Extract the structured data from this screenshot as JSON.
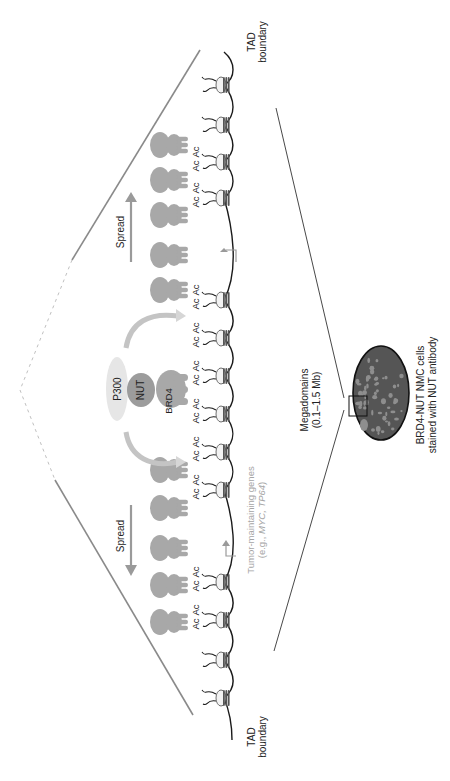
{
  "figure": {
    "orientation": "rotated-90-ccw",
    "labels": {
      "tad_boundary_top_line1": "TAD",
      "tad_boundary_top_line2": "boundary",
      "tad_boundary_bottom_line1": "TAD",
      "tad_boundary_bottom_line2": "boundary",
      "spread_upper": "Spread",
      "spread_lower": "Spread",
      "p300": "P300",
      "nut": "NUT",
      "brd4": "BRD4",
      "acetyl_mark": "Ac",
      "genes_line1": "Tumor-maintaining genes",
      "genes_line2_prefix": "(e.g., ",
      "genes_line2_italic": "MYC, TP64",
      "genes_line2_suffix": ")",
      "megadomains_line1": "Megadomains",
      "megadomains_line2": "(0.1–1.5 Mb)",
      "cells_line1": "BRD4-NUT NMC cells",
      "cells_line2": "stained with NUT antibody"
    },
    "colors": {
      "background": "#ffffff",
      "chromatin_fiber": "#1a1a1a",
      "nucleosome_fill": "#f2f2f2",
      "nucleosome_band": "#555555",
      "brd4_nut_complex": "#a8a8a8",
      "nut_center": "#9c9c9c",
      "p300": "#e4e4e4",
      "spread_arrow": "#9a9a9a",
      "recruit_arrow": "#c8c8c8",
      "triangle_edge": "#8a8a8a",
      "gene_label": "#a5a5a5",
      "nucleus_fill": "#555555",
      "nucleus_spots": "#8e8e8e",
      "text": "#222222"
    },
    "nucleosomes_y": [
      85,
      125,
      162,
      198,
      300,
      338,
      376,
      414,
      452,
      490,
      582,
      620,
      660,
      698
    ],
    "acetylated_nucleosomes_y": [
      162,
      198,
      300,
      338,
      376,
      414,
      452,
      490,
      582,
      620
    ],
    "brd4_nut_complexes_y": [
      145,
      180,
      215,
      255,
      290,
      470,
      508,
      548,
      585,
      622
    ],
    "tss_arrows_y": [
      248,
      545
    ]
  }
}
